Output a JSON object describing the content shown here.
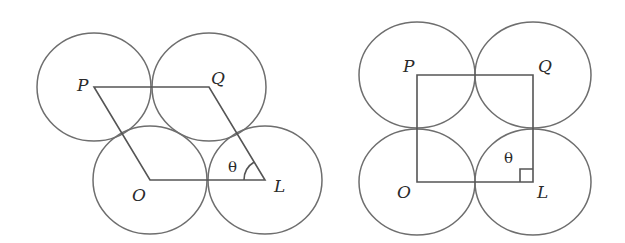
{
  "figures": [
    {
      "name": "rhombic-packing",
      "vertices": {
        "P": {
          "label": "P",
          "x": 93,
          "y": 87
        },
        "Q": {
          "label": "Q",
          "x": 209,
          "y": 87
        },
        "O": {
          "label": "O",
          "x": 150,
          "y": 180
        },
        "L": {
          "label": "L",
          "x": 265,
          "y": 180
        }
      },
      "angle_label": "θ",
      "angle_marker": "arc"
    },
    {
      "name": "square-packing",
      "vertices": {
        "P": {
          "label": "P",
          "x": 417,
          "y": 75
        },
        "Q": {
          "label": "Q",
          "x": 533,
          "y": 75
        },
        "O": {
          "label": "O",
          "x": 417,
          "y": 182
        },
        "L": {
          "label": "L",
          "x": 533,
          "y": 182
        }
      },
      "angle_label": "θ",
      "angle_marker": "right-angle"
    }
  ],
  "colors": {
    "stroke": "#555555",
    "circle": "#6e6e6e",
    "text": "#2a2a2a",
    "background": "#ffffff"
  }
}
